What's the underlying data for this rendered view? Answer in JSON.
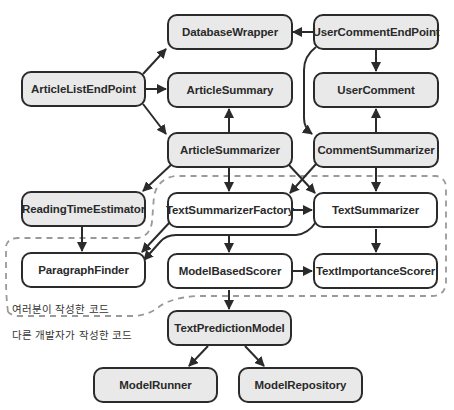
{
  "diagram": {
    "nodes": [
      {
        "id": "DatabaseWrapper",
        "label": "DatabaseWrapper",
        "group": "other"
      },
      {
        "id": "UserCommentEndPoint",
        "label": "UserCommentEndPoint",
        "group": "other"
      },
      {
        "id": "ArticleListEndPoint",
        "label": "ArticleListEndPoint",
        "group": "other"
      },
      {
        "id": "ArticleSummary",
        "label": "ArticleSummary",
        "group": "other"
      },
      {
        "id": "UserComment",
        "label": "UserComment",
        "group": "other"
      },
      {
        "id": "ArticleSummarizer",
        "label": "ArticleSummarizer",
        "group": "other"
      },
      {
        "id": "CommentSummarizer",
        "label": "CommentSummarizer",
        "group": "other"
      },
      {
        "id": "ReadingTimeEstimator",
        "label": "ReadingTimeEstimator",
        "group": "other"
      },
      {
        "id": "TextSummarizerFactory",
        "label": "TextSummarizerFactory",
        "group": "mine"
      },
      {
        "id": "TextSummarizer",
        "label": "TextSummarizer",
        "group": "mine"
      },
      {
        "id": "ParagraphFinder",
        "label": "ParagraphFinder",
        "group": "mine"
      },
      {
        "id": "ModelBasedScorer",
        "label": "ModelBasedScorer",
        "group": "mine"
      },
      {
        "id": "TextImportanceScorer",
        "label": "TextImportanceScorer",
        "group": "mine"
      },
      {
        "id": "TextPredictionModel",
        "label": "TextPredictionModel",
        "group": "other"
      },
      {
        "id": "ModelRunner",
        "label": "ModelRunner",
        "group": "other"
      },
      {
        "id": "ModelRepository",
        "label": "ModelRepository",
        "group": "other"
      }
    ],
    "edges": [
      {
        "from": "ArticleListEndPoint",
        "to": "DatabaseWrapper"
      },
      {
        "from": "ArticleListEndPoint",
        "to": "ArticleSummary"
      },
      {
        "from": "ArticleListEndPoint",
        "to": "ArticleSummarizer"
      },
      {
        "from": "UserCommentEndPoint",
        "to": "DatabaseWrapper"
      },
      {
        "from": "UserCommentEndPoint",
        "to": "UserComment"
      },
      {
        "from": "UserCommentEndPoint",
        "to": "CommentSummarizer"
      },
      {
        "from": "ArticleSummarizer",
        "to": "ArticleSummary"
      },
      {
        "from": "ArticleSummarizer",
        "to": "ReadingTimeEstimator"
      },
      {
        "from": "ArticleSummarizer",
        "to": "TextSummarizerFactory"
      },
      {
        "from": "ArticleSummarizer",
        "to": "TextSummarizer"
      },
      {
        "from": "CommentSummarizer",
        "to": "UserComment"
      },
      {
        "from": "CommentSummarizer",
        "to": "TextSummarizerFactory"
      },
      {
        "from": "CommentSummarizer",
        "to": "TextSummarizer"
      },
      {
        "from": "ReadingTimeEstimator",
        "to": "ParagraphFinder"
      },
      {
        "from": "TextSummarizerFactory",
        "to": "TextSummarizer"
      },
      {
        "from": "TextSummarizerFactory",
        "to": "ParagraphFinder"
      },
      {
        "from": "TextSummarizerFactory",
        "to": "ModelBasedScorer"
      },
      {
        "from": "TextSummarizer",
        "to": "ParagraphFinder"
      },
      {
        "from": "TextSummarizer",
        "to": "TextImportanceScorer"
      },
      {
        "from": "ModelBasedScorer",
        "to": "TextImportanceScorer"
      },
      {
        "from": "ModelBasedScorer",
        "to": "TextPredictionModel"
      },
      {
        "from": "TextPredictionModel",
        "to": "ModelRunner"
      },
      {
        "from": "TextPredictionModel",
        "to": "ModelRepository"
      }
    ],
    "boundary": {
      "inside_label": "여러분이 작성한 코드",
      "outside_label": "다른 개발자가 작성한 코드"
    },
    "colors": {
      "other_fill": "#e9e9e9",
      "mine_fill": "#ffffff",
      "stroke": "#2b2b2b",
      "boundary": "#9a9a9a"
    }
  }
}
